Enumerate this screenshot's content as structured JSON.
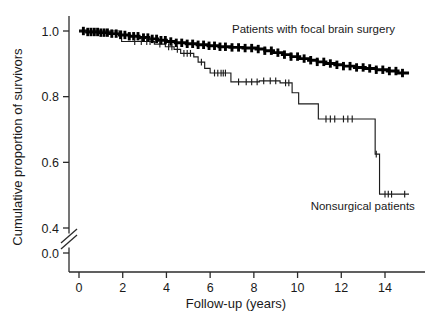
{
  "chart_data": {
    "type": "line",
    "title": "",
    "xlabel": "Follow-up (years)",
    "ylabel": "Cumulative proportion of survivors",
    "xlim": [
      0,
      15.4
    ],
    "ylim": [
      0.3,
      1.02
    ],
    "grid": false,
    "legend_position": "inline-annotations",
    "axis_break": {
      "axis": "y",
      "between": [
        0.0,
        0.4
      ],
      "style": "double-slash"
    },
    "xticks": [
      0,
      2,
      4,
      6,
      8,
      10,
      12,
      14
    ],
    "xticklabels": [
      "0",
      "2",
      "4",
      "6",
      "8",
      "10",
      "12",
      "14"
    ],
    "yticks": [
      1.0,
      0.8,
      0.6,
      0.4,
      0.0
    ],
    "yticklabels": [
      "1.0",
      "0.8",
      "0.6",
      "0.4",
      "0.0"
    ],
    "annotations": [
      {
        "text": "Patients with focal brain surgery",
        "x": 7.0,
        "y": 0.995
      },
      {
        "text": "Nonsurgical patients",
        "x": 10.6,
        "y": 0.455
      }
    ],
    "series": [
      {
        "name": "Patients with focal brain surgery",
        "style": "step",
        "linewidth": "thick",
        "points": [
          [
            0.0,
            1.0
          ],
          [
            0.35,
            1.0
          ],
          [
            0.35,
            0.997
          ],
          [
            0.9,
            0.997
          ],
          [
            0.9,
            0.995
          ],
          [
            1.4,
            0.995
          ],
          [
            1.4,
            0.992
          ],
          [
            1.85,
            0.992
          ],
          [
            1.85,
            0.988
          ],
          [
            2.3,
            0.988
          ],
          [
            2.3,
            0.984
          ],
          [
            2.75,
            0.984
          ],
          [
            2.75,
            0.98
          ],
          [
            3.2,
            0.98
          ],
          [
            3.2,
            0.976
          ],
          [
            3.6,
            0.976
          ],
          [
            3.6,
            0.972
          ],
          [
            4.0,
            0.972
          ],
          [
            4.0,
            0.968
          ],
          [
            4.4,
            0.968
          ],
          [
            4.4,
            0.964
          ],
          [
            4.9,
            0.964
          ],
          [
            4.9,
            0.961
          ],
          [
            5.4,
            0.961
          ],
          [
            5.4,
            0.958
          ],
          [
            5.9,
            0.958
          ],
          [
            5.9,
            0.955
          ],
          [
            6.4,
            0.955
          ],
          [
            6.4,
            0.952
          ],
          [
            6.9,
            0.952
          ],
          [
            6.9,
            0.95
          ],
          [
            7.5,
            0.95
          ],
          [
            7.5,
            0.948
          ],
          [
            8.1,
            0.948
          ],
          [
            8.1,
            0.945
          ],
          [
            8.5,
            0.945
          ],
          [
            8.5,
            0.94
          ],
          [
            8.9,
            0.94
          ],
          [
            8.9,
            0.934
          ],
          [
            9.3,
            0.934
          ],
          [
            9.3,
            0.928
          ],
          [
            9.7,
            0.928
          ],
          [
            9.7,
            0.922
          ],
          [
            10.1,
            0.922
          ],
          [
            10.1,
            0.916
          ],
          [
            10.5,
            0.916
          ],
          [
            10.5,
            0.911
          ],
          [
            10.9,
            0.911
          ],
          [
            10.9,
            0.906
          ],
          [
            11.3,
            0.906
          ],
          [
            11.3,
            0.901
          ],
          [
            11.7,
            0.901
          ],
          [
            11.7,
            0.897
          ],
          [
            12.1,
            0.897
          ],
          [
            12.1,
            0.893
          ],
          [
            12.6,
            0.893
          ],
          [
            12.6,
            0.889
          ],
          [
            13.1,
            0.889
          ],
          [
            13.1,
            0.886
          ],
          [
            13.6,
            0.886
          ],
          [
            13.6,
            0.882
          ],
          [
            14.1,
            0.882
          ],
          [
            14.1,
            0.878
          ],
          [
            14.6,
            0.878
          ],
          [
            14.6,
            0.872
          ],
          [
            15.1,
            0.872
          ]
        ],
        "censor_marks": [
          0.2,
          0.4,
          0.55,
          0.7,
          0.85,
          1.0,
          1.15,
          1.3,
          1.5,
          1.7,
          1.9,
          2.1,
          2.3,
          2.5,
          2.7,
          2.95,
          3.15,
          3.35,
          3.55,
          3.75,
          3.95,
          4.2,
          4.45,
          4.7,
          4.95,
          5.2,
          5.45,
          5.7,
          5.95,
          6.2,
          6.45,
          6.7,
          7.0,
          7.3,
          7.6,
          7.9,
          8.2,
          8.5,
          8.8,
          9.1,
          9.4,
          9.7,
          10.0,
          10.3,
          10.6,
          10.9,
          11.2,
          11.5,
          11.8,
          12.1,
          12.4,
          12.7,
          13.0,
          13.3,
          13.6,
          13.9,
          14.2,
          14.5,
          14.8
        ]
      },
      {
        "name": "Nonsurgical patients",
        "style": "step",
        "linewidth": "thin",
        "points": [
          [
            0.0,
            1.0
          ],
          [
            1.95,
            1.0
          ],
          [
            1.95,
            0.968
          ],
          [
            3.45,
            0.968
          ],
          [
            3.45,
            0.96
          ],
          [
            3.95,
            0.96
          ],
          [
            3.95,
            0.952
          ],
          [
            4.35,
            0.952
          ],
          [
            4.35,
            0.944
          ],
          [
            4.65,
            0.944
          ],
          [
            4.65,
            0.932
          ],
          [
            5.25,
            0.932
          ],
          [
            5.25,
            0.921
          ],
          [
            5.45,
            0.921
          ],
          [
            5.45,
            0.905
          ],
          [
            5.75,
            0.905
          ],
          [
            5.75,
            0.886
          ],
          [
            6.0,
            0.886
          ],
          [
            6.0,
            0.872
          ],
          [
            6.95,
            0.872
          ],
          [
            6.95,
            0.845
          ],
          [
            8.25,
            0.845
          ],
          [
            8.25,
            0.848
          ],
          [
            9.2,
            0.848
          ],
          [
            9.2,
            0.842
          ],
          [
            9.75,
            0.842
          ],
          [
            9.75,
            0.812
          ],
          [
            10.05,
            0.812
          ],
          [
            10.05,
            0.778
          ],
          [
            10.95,
            0.778
          ],
          [
            10.95,
            0.732
          ],
          [
            13.55,
            0.732
          ],
          [
            13.55,
            0.625
          ],
          [
            13.75,
            0.625
          ],
          [
            13.75,
            0.503
          ],
          [
            15.1,
            0.503
          ]
        ],
        "censor_marks": [
          2.55,
          2.85,
          3.1,
          3.25,
          3.7,
          4.1,
          4.25,
          4.5,
          4.8,
          4.95,
          5.1,
          5.6,
          6.2,
          6.35,
          6.5,
          6.6,
          6.7,
          7.3,
          7.65,
          7.9,
          8.15,
          8.45,
          8.75,
          9.0,
          9.45,
          9.6,
          11.3,
          11.5,
          11.7,
          12.1,
          12.3,
          12.5,
          13.6,
          14.0,
          14.15,
          14.3,
          14.9
        ]
      }
    ]
  },
  "figure": {
    "background_color": "#ffffff",
    "axis_color": "#2b2b2b",
    "surgical_color": "#000000",
    "nonsurgical_color": "#1c1c1c"
  }
}
